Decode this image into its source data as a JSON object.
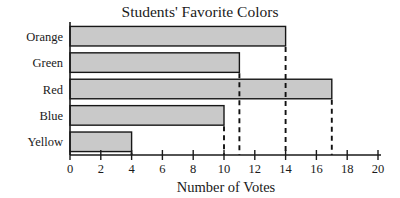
{
  "chart_data": {
    "type": "bar",
    "orientation": "horizontal",
    "title": "Students' Favorite Colors",
    "xlabel": "Number of Votes",
    "ylabel": "",
    "categories": [
      "Orange",
      "Green",
      "Red",
      "Blue",
      "Yellow"
    ],
    "values": [
      14,
      11,
      17,
      10,
      4
    ],
    "xlim": [
      0,
      20
    ],
    "xticks": [
      0,
      2,
      4,
      6,
      8,
      10,
      12,
      14,
      16,
      18,
      20
    ],
    "xtick_labels": [
      "0",
      "2",
      "4",
      "6",
      "8",
      "10",
      "12",
      "14",
      "16",
      "18",
      "20"
    ],
    "grid": false,
    "legend": null,
    "annotations": [
      {
        "type": "dashed-drop-line",
        "value": 10,
        "from_category": "Blue"
      },
      {
        "type": "dashed-drop-line",
        "value": 11,
        "from_category": "Green"
      },
      {
        "type": "dashed-drop-line",
        "value": 14,
        "from_category": "Orange"
      },
      {
        "type": "dashed-drop-line",
        "value": 17,
        "from_category": "Red"
      }
    ],
    "colors": {
      "bar_fill": "#c9c9c9",
      "bar_stroke": "#171717",
      "axis": "#1a1a1a",
      "text": "#1a1a1a",
      "background": "#ffffff"
    }
  }
}
